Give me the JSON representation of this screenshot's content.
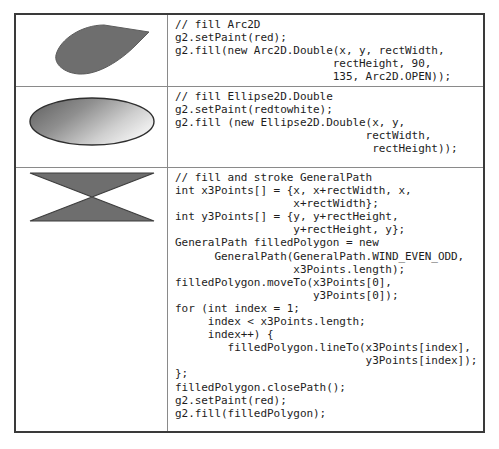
{
  "figure": {
    "type": "code-illustration-table",
    "columns": [
      "rendered-shape",
      "java2d-source-code"
    ],
    "rows": [
      {
        "id": "arc2d",
        "shape": {
          "name": "arc2d-open-wedge",
          "description": "filled Arc2D OPEN wedge, start angle 90 degrees, extent 135 degrees",
          "fill_color": "#6e6e6e",
          "stroke_color": "#5a5a5a"
        },
        "code": "// fill Arc2D\ng2.setPaint(red);\ng2.fill(new Arc2D.Double(x, y, rectWidth,\n                        rectHeight, 90,\n                        135, Arc2D.OPEN));"
      },
      {
        "id": "ellipse2d",
        "shape": {
          "name": "ellipse2d-gradient",
          "description": "filled Ellipse2D with red-to-white gradient paint",
          "fill_color_start": "#5f5f5f",
          "fill_color_end": "#e8e8e8",
          "stroke_color": "#2f2f2f"
        },
        "code": "// fill Ellipse2D.Double\ng2.setPaint(redtowhite);\ng2.fill (new Ellipse2D.Double(x, y,\n                             rectWidth,\n                              rectHeight));"
      },
      {
        "id": "generalpath",
        "shape": {
          "name": "generalpath-bowtie",
          "description": "filled GeneralPath bowtie / hourglass polygon with WIND_EVEN_ODD",
          "fill_color": "#6e6e6e",
          "stroke_color": "#3d3d3d"
        },
        "code": "// fill and stroke GeneralPath\nint x3Points[] = {x, x+rectWidth, x,\n                  x+rectWidth};\nint y3Points[] = {y, y+rectHeight,\n                  y+rectHeight, y};\nGeneralPath filledPolygon = new\n      GeneralPath(GeneralPath.WIND_EVEN_ODD,\n                  x3Points.length);\nfilledPolygon.moveTo(x3Points[0],\n                     y3Points[0]);\nfor (int index = 1;\n     index < x3Points.length;\n     index++) {\n        filledPolygon.lineTo(x3Points[index],\n                             y3Points[index]);\n};\nfilledPolygon.closePath();\ng2.setPaint(red);\ng2.fill(filledPolygon);"
      }
    ]
  },
  "colors": {
    "page_background": "#ffffff",
    "table_border": "#3a3a3a",
    "cell_divider": "#8a8a8a",
    "code_text": "#1d1d1d"
  }
}
